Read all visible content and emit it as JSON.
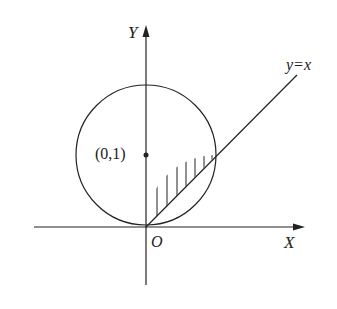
{
  "diagram": {
    "axes": {
      "x_label": "X",
      "y_label": "Y",
      "origin_label": "O"
    },
    "circle": {
      "center_label": "(0,1)",
      "center": [
        0,
        1
      ],
      "radius": 1
    },
    "line": {
      "label": "y=x"
    },
    "shaded_region": "region between the line y=x and the lower-right arc of the circle, from origin to intersection (1,1)",
    "colors": {
      "ink": "#222222",
      "background": "#ffffff"
    }
  }
}
